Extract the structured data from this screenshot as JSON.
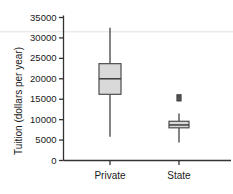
{
  "chart_data": {
    "type": "box",
    "title": "",
    "xlabel": "",
    "ylabel": "Tuition (dollars per year)",
    "categories": [
      "Private",
      "State"
    ],
    "ylim": [
      0,
      35000
    ],
    "yticks": [
      0,
      5000,
      10000,
      15000,
      20000,
      25000,
      30000,
      35000
    ],
    "ytick_labels": [
      "0",
      "5000",
      "10000",
      "15000",
      "20000",
      "25000",
      "30000",
      "35000"
    ],
    "grid": false,
    "legend": "none",
    "boxes": [
      {
        "name": "Private",
        "whisker_low": 5800,
        "q1": 16200,
        "median": 20000,
        "q3": 23700,
        "whisker_high": 32500,
        "outliers": []
      },
      {
        "name": "State",
        "whisker_low": 4400,
        "q1": 8000,
        "median": 8700,
        "q3": 9600,
        "whisker_high": 11500,
        "outliers": [
          14900,
          15200,
          15500,
          15800
        ]
      }
    ]
  },
  "style": {
    "axis_color": "#333333",
    "box_fill": "#d9d9d9",
    "box_edge": "#4d4d4d",
    "median_color": "#333333",
    "whisker_color": "#333333",
    "outlier_color": "#404040",
    "gridline_color": "#e2e2e2",
    "text_color": "#1a1a1a"
  },
  "annotations": {
    "faint_rule_value": 31500
  }
}
